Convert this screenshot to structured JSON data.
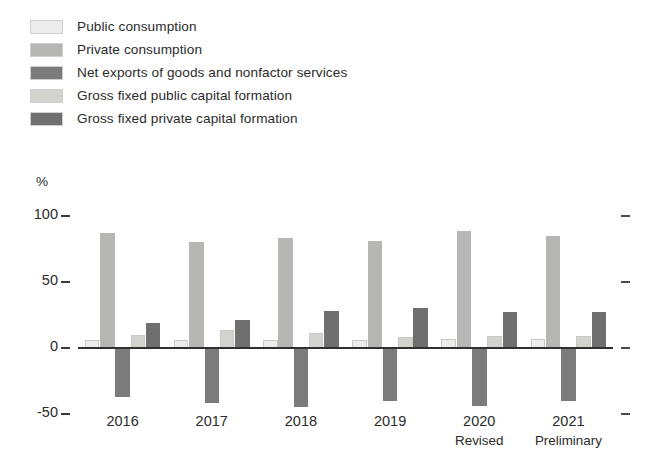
{
  "figure": {
    "unit_label": "%",
    "colors": {
      "public_consumption": "#ececed",
      "private_consumption": "#b6b6b4",
      "net_exports": "#7b7b7b",
      "gross_fixed_public": "#d2d2cf",
      "gross_fixed_private": "#6f6f6f",
      "axis": "#2f2f2f",
      "text": "#2b2b2b"
    }
  },
  "legend": {
    "position": "top-left",
    "items": [
      {
        "label": "Public consumption",
        "color": "#ececed"
      },
      {
        "label": "Private consumption",
        "color": "#b6b6b4"
      },
      {
        "label": "Net exports of goods and nonfactor services",
        "color": "#7b7b7b"
      },
      {
        "label": "Gross fixed public capital formation",
        "color": "#d2d2cf"
      },
      {
        "label": "Gross fixed private capital formation",
        "color": "#6f6f6f"
      }
    ]
  },
  "axis": {
    "y_ticks": [
      "100",
      "50",
      "0",
      "-50"
    ],
    "x_labels": [
      {
        "year": "2016",
        "sub": ""
      },
      {
        "year": "2017",
        "sub": ""
      },
      {
        "year": "2018",
        "sub": ""
      },
      {
        "year": "2019",
        "sub": ""
      },
      {
        "year": "2020",
        "sub": "Revised"
      },
      {
        "year": "2021",
        "sub": "Preliminary"
      }
    ]
  },
  "chart_data": {
    "type": "bar",
    "title": "",
    "subtitle": "",
    "xlabel": "",
    "ylabel": "%",
    "ylim": [
      -60,
      105
    ],
    "yticks": [
      -50,
      0,
      50,
      100
    ],
    "grid": false,
    "legend_position": "top-left",
    "categories": [
      "2016",
      "2017",
      "2018",
      "2019",
      "2020 Revised",
      "2021 Preliminary"
    ],
    "series": [
      {
        "name": "Public consumption",
        "color": "#ececed",
        "values": [
          6,
          6,
          6,
          6,
          7,
          7
        ]
      },
      {
        "name": "Private consumption",
        "color": "#b6b6b4",
        "values": [
          87,
          80,
          83,
          81,
          89,
          85
        ]
      },
      {
        "name": "Net exports of goods and nonfactor services",
        "color": "#7b7b7b",
        "values": [
          -37,
          -42,
          -45,
          -40,
          -44,
          -40
        ]
      },
      {
        "name": "Gross fixed public capital formation",
        "color": "#d2d2cf",
        "values": [
          10,
          14,
          11,
          8,
          9,
          9
        ]
      },
      {
        "name": "Gross fixed private capital formation",
        "color": "#6f6f6f",
        "values": [
          19,
          21,
          28,
          30,
          27,
          27
        ]
      }
    ]
  }
}
